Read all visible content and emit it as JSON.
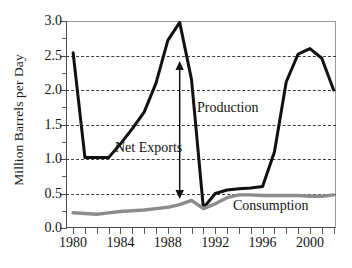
{
  "chart_data": {
    "type": "line",
    "title": "",
    "xlabel": "",
    "ylabel": "Million Barrels per Day",
    "xlim": [
      1979.4,
      2002.2
    ],
    "ylim": [
      0.0,
      3.0
    ],
    "grid": true,
    "legend_position": "inline-annotations",
    "x_tick_labels": [
      "1980",
      "1984",
      "1988",
      "1992",
      "1996",
      "2000"
    ],
    "x_tick_values": [
      1980,
      1984,
      1988,
      1992,
      1996,
      2000
    ],
    "x_minor_ticks": [
      1980,
      1981,
      1982,
      1983,
      1984,
      1985,
      1986,
      1987,
      1988,
      1989,
      1990,
      1991,
      1992,
      1993,
      1994,
      1995,
      1996,
      1997,
      1998,
      1999,
      2000,
      2001,
      2002
    ],
    "y_tick_labels": [
      "3.0",
      "2.5",
      "2.0",
      "1.5",
      "1.0",
      "0.5",
      "0.0"
    ],
    "y_tick_values": [
      3.0,
      2.5,
      2.0,
      1.5,
      1.0,
      0.5,
      0.0
    ],
    "y_minor_ticks": [
      2.75,
      2.25,
      1.75,
      1.25,
      0.75,
      0.25
    ],
    "gridline_values": [
      2.5,
      2.0,
      1.5,
      1.0,
      0.5
    ],
    "x": [
      1980,
      1981,
      1982,
      1983,
      1984,
      1985,
      1986,
      1987,
      1988,
      1989,
      1990,
      1991,
      1992,
      1993,
      1994,
      1995,
      1996,
      1997,
      1998,
      1999,
      2000,
      2001,
      2002
    ],
    "series": [
      {
        "name": "Production",
        "color": "#111111",
        "values": [
          2.54,
          1.02,
          1.02,
          1.02,
          1.22,
          1.44,
          1.68,
          2.1,
          2.72,
          2.98,
          2.15,
          0.29,
          0.5,
          0.55,
          0.57,
          0.58,
          0.6,
          1.1,
          2.12,
          2.52,
          2.6,
          2.46,
          2.0
        ]
      },
      {
        "name": "Consumption",
        "color": "#8c8c8c",
        "values": [
          0.22,
          0.21,
          0.2,
          0.22,
          0.24,
          0.25,
          0.26,
          0.28,
          0.3,
          0.34,
          0.4,
          0.28,
          0.35,
          0.44,
          0.48,
          0.48,
          0.47,
          0.47,
          0.47,
          0.47,
          0.46,
          0.46,
          0.48
        ]
      }
    ],
    "annotations": [
      {
        "name": "net-exports",
        "text": "Net Exports",
        "x": 1986.2,
        "y": 1.25
      },
      {
        "name": "production",
        "text": "Production",
        "x": 1990.8,
        "y": 1.85
      },
      {
        "name": "consumption",
        "text": "Consumption",
        "x": 1993.9,
        "y": 0.38
      },
      {
        "name": "net-exports-arrow",
        "text": "",
        "x": 1989.0,
        "y_top": 2.42,
        "y_bottom": 0.42,
        "style": "double-headed-arrow"
      }
    ]
  }
}
